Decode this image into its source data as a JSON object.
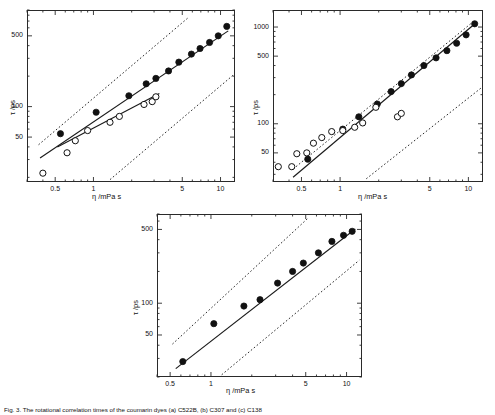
{
  "figure": {
    "caption": "Fig. 3. The rotational correlation times of the coumarin dyes (a) C522B, (b) C307 and (c) C138",
    "axis_labels": {
      "x": "η /mPa s",
      "y": "τ /ps"
    }
  },
  "chart_data": [
    {
      "type": "scatter",
      "title": "(a) C522B",
      "xlabel": "η /mPa s",
      "ylabel": "τ /ps",
      "xscale": "log",
      "yscale": "log",
      "xlim": [
        0.3,
        13
      ],
      "ylim": [
        18,
        900
      ],
      "xticks": [
        0.5,
        1,
        5,
        10
      ],
      "xticklabels": [
        "0.5",
        "1",
        "5",
        "10"
      ],
      "yticks": [
        50,
        100,
        500
      ],
      "yticklabels": [
        "50",
        "100",
        "500"
      ],
      "grid": false,
      "legend": "none",
      "series": [
        {
          "name": "filled-circles",
          "marker": "filled-circle",
          "x": [
            0.55,
            1.05,
            1.9,
            2.6,
            3.1,
            3.9,
            4.7,
            5.9,
            6.9,
            8.2,
            9.6,
            11.2
          ],
          "y": [
            54,
            88,
            128,
            168,
            190,
            225,
            275,
            330,
            375,
            430,
            500,
            620
          ]
        },
        {
          "name": "open-circles",
          "marker": "open-circle",
          "x": [
            0.4,
            0.62,
            0.72,
            0.9,
            1.35,
            1.6,
            2.5,
            2.9,
            3.1
          ],
          "y": [
            22,
            35,
            46,
            58,
            70,
            80,
            105,
            112,
            125
          ]
        }
      ],
      "fit_lines": [
        {
          "name": "fit-filled",
          "style": "solid",
          "x": [
            0.38,
            11.5
          ],
          "y": [
            31,
            560
          ]
        },
        {
          "name": "fit-open",
          "style": "solid",
          "x": [
            0.52,
            3.3
          ],
          "y": [
            40,
            135
          ]
        }
      ],
      "reference_lines": [
        {
          "name": "stick-limit",
          "style": "dotted",
          "x": [
            0.37,
            5.6
          ],
          "y": [
            42,
            760
          ]
        },
        {
          "name": "slip-limit",
          "style": "dotted",
          "x": [
            1.35,
            12.6
          ],
          "y": [
            19,
            205
          ]
        }
      ]
    },
    {
      "type": "scatter",
      "title": "(b) C307",
      "xlabel": "η /mPa s",
      "ylabel": "τ /ps",
      "xscale": "log",
      "yscale": "log",
      "xlim": [
        0.3,
        13
      ],
      "ylim": [
        25,
        1500
      ],
      "xticks": [
        0.5,
        1,
        5,
        10
      ],
      "xticklabels": [
        "0.5",
        "1",
        "5",
        "10"
      ],
      "yticks": [
        50,
        100,
        500,
        1000
      ],
      "yticklabels": [
        "50",
        "100",
        "500",
        "1000"
      ],
      "grid": false,
      "legend": "none",
      "series": [
        {
          "name": "filled-circles",
          "marker": "filled-circle",
          "x": [
            0.56,
            1.05,
            1.4,
            1.95,
            2.5,
            3.0,
            3.6,
            4.5,
            5.6,
            6.8,
            8.1,
            9.6,
            11.2
          ],
          "y": [
            43,
            88,
            118,
            160,
            215,
            260,
            320,
            400,
            480,
            570,
            680,
            830,
            1080
          ]
        },
        {
          "name": "open-circles",
          "marker": "open-circle",
          "x": [
            0.33,
            0.42,
            0.46,
            0.55,
            0.62,
            0.72,
            0.86,
            1.05,
            1.3,
            1.5,
            1.9,
            2.8,
            3.0
          ],
          "y": [
            36,
            36,
            49,
            50,
            63,
            72,
            83,
            85,
            92,
            102,
            148,
            118,
            128
          ]
        }
      ],
      "fit_lines": [
        {
          "name": "fit-filled",
          "style": "solid",
          "x": [
            0.43,
            11.6
          ],
          "y": [
            28,
            1120
          ]
        }
      ],
      "reference_lines": [
        {
          "name": "stick-limit",
          "style": "dotted",
          "x": [
            0.43,
            11.3
          ],
          "y": [
            34,
            1180
          ]
        },
        {
          "name": "slip-limit",
          "style": "dotted",
          "x": [
            1.6,
            12.6
          ],
          "y": [
            27,
            235
          ]
        }
      ]
    },
    {
      "type": "scatter",
      "title": "(c) C138",
      "xlabel": "η /mPa s",
      "ylabel": "τ /ps",
      "xscale": "log",
      "yscale": "log",
      "xlim": [
        0.4,
        13
      ],
      "ylim": [
        20,
        700
      ],
      "xticks": [
        0.5,
        1,
        5,
        10
      ],
      "xticklabels": [
        "0.5",
        "1",
        "5",
        "10"
      ],
      "yticks": [
        50,
        100,
        500
      ],
      "yticklabels": [
        "50",
        "100",
        "500"
      ],
      "grid": false,
      "legend": "none",
      "series": [
        {
          "name": "filled-circles",
          "marker": "filled-circle",
          "x": [
            0.62,
            1.05,
            1.75,
            2.3,
            3.1,
            4.0,
            4.8,
            6.2,
            7.8,
            9.5,
            11.0
          ],
          "y": [
            28,
            64,
            94,
            108,
            155,
            200,
            240,
            300,
            385,
            440,
            480
          ]
        }
      ],
      "fit_lines": [
        {
          "name": "fit-filled",
          "style": "solid",
          "x": [
            0.55,
            11.6
          ],
          "y": [
            24,
            505
          ]
        }
      ],
      "reference_lines": [
        {
          "name": "stick-limit",
          "style": "dotted",
          "x": [
            0.52,
            5.2
          ],
          "y": [
            41,
            640
          ]
        },
        {
          "name": "slip-limit",
          "style": "dotted",
          "x": [
            1.2,
            12.4
          ],
          "y": [
            21,
            255
          ]
        }
      ]
    }
  ]
}
